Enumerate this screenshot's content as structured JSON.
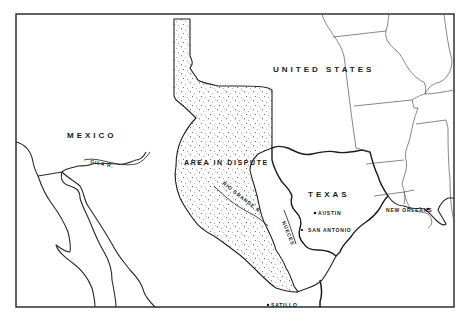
{
  "map": {
    "title": "",
    "regions": {
      "mexico": "MEXICO",
      "united_states": "UNITED STATES",
      "texas": "TEXAS",
      "area_in_dispute": "AREA IN DISPUTE"
    },
    "rivers": {
      "gila": "GILA R.",
      "rio_grande": "RIO GRANDE R.",
      "nueces": "NUECES"
    },
    "cities": [
      {
        "name": "AUSTIN"
      },
      {
        "name": "SAN ANTONIO"
      },
      {
        "name": "NEW ORLEANS"
      },
      {
        "name": "SATILLO"
      }
    ],
    "legend": {
      "disputed_fill": "stippled",
      "ink_color": "#1c1c1c",
      "paper_color": "#ffffff"
    }
  }
}
